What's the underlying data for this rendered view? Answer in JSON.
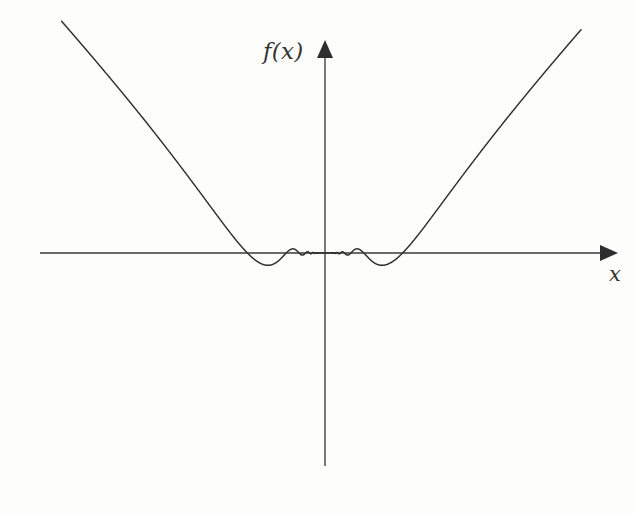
{
  "figure": {
    "kind": "math-function-plot",
    "background_color": "#fdfdfc",
    "curve_color": "#2f2f2f",
    "axis_color": "#3a3a3a",
    "width": 636,
    "height": 516
  },
  "axes": {
    "y_axis_label": "f(x)",
    "x_axis_label": "x",
    "origin_px": {
      "x": 325,
      "y": 253
    },
    "x_axis_start_px": 40,
    "x_axis_end_px": 607,
    "y_axis_top_px": 44,
    "y_axis_bottom_px": 466,
    "has_ticks": false,
    "has_tick_labels": false,
    "has_gridlines": false,
    "arrowheads": [
      "x-positive",
      "y-positive"
    ]
  },
  "chart_data": {
    "type": "line",
    "title": "",
    "subtitle": "",
    "xlabel": "x",
    "ylabel": "f(x)",
    "grid": false,
    "legend": null,
    "legend_position": "none",
    "tick_labels": {
      "x": [],
      "y": []
    },
    "xlim": [
      -1.08,
      1.05
    ],
    "ylim": [
      -1.18,
      1.05
    ],
    "formula": "f(x) = x^2 * sin(1/x)",
    "formula_note": "amplitude envelope grows as x^2; oscillation frequency grows without bound as x approaches 0",
    "symmetry": "even",
    "value_at_zero": 0,
    "series": [
      {
        "name": "f(x)",
        "color": "#2f2f2f",
        "stroke_width": 1.45,
        "envelope_exponent": 2,
        "phase_scale": 1.0,
        "sampled_extrema_px": [
          {
            "type": "peak",
            "x": 95,
            "y": 38
          },
          {
            "type": "trough",
            "x": 138,
            "y": 400
          },
          {
            "type": "peak",
            "x": 169,
            "y": 160
          },
          {
            "type": "trough",
            "x": 192,
            "y": 328
          },
          {
            "type": "peak",
            "x": 212,
            "y": 203
          },
          {
            "type": "trough",
            "x": 225,
            "y": 295
          },
          {
            "type": "peak",
            "x": 240,
            "y": 227
          },
          {
            "type": "trough",
            "x": 250,
            "y": 279
          },
          {
            "type": "peak",
            "x": 259,
            "y": 238
          },
          {
            "type": "trough",
            "x": 267,
            "y": 268
          },
          {
            "type": "peak",
            "x": 420,
            "y": 227
          },
          {
            "type": "trough",
            "x": 432,
            "y": 282
          },
          {
            "type": "peak",
            "x": 443,
            "y": 214
          },
          {
            "type": "trough",
            "x": 455,
            "y": 300
          },
          {
            "type": "peak",
            "x": 466,
            "y": 165
          },
          {
            "type": "trough",
            "x": 486,
            "y": 345
          },
          {
            "type": "peak",
            "x": 511,
            "y": 113
          },
          {
            "type": "trough",
            "x": 553,
            "y": 478
          }
        ],
        "left_branch_clipped_at_px": {
          "x": 58,
          "y": 492
        },
        "right_branch_clipped_at_px": {
          "x": 596,
          "y": 24
        }
      }
    ]
  },
  "labels": {
    "f_of_x": "f(x)",
    "x": "x"
  }
}
